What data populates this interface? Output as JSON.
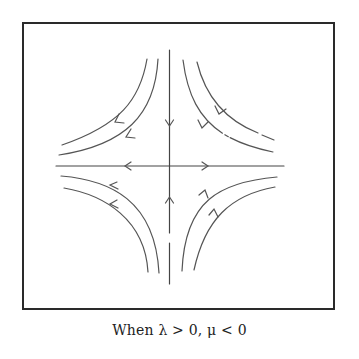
{
  "figure": {
    "caption": "When λ > 0, μ < 0",
    "colors": {
      "frame": "#2a2a2a",
      "curves": "#555555",
      "axes": "#444444",
      "background": "#ffffff"
    },
    "axes": {
      "horizontal": {
        "direction": "outward",
        "arrows": [
          "left",
          "right"
        ]
      },
      "vertical": {
        "direction": "inward",
        "arrows": [
          "down",
          "up"
        ]
      }
    },
    "trajectories": [
      {
        "quadrant": "top-left",
        "count": 2,
        "flow": "down then left"
      },
      {
        "quadrant": "top-right",
        "count": 2,
        "flow": "down then right"
      },
      {
        "quadrant": "bottom-left",
        "count": 2,
        "flow": "up then left"
      },
      {
        "quadrant": "bottom-right",
        "count": 2,
        "flow": "up then right"
      }
    ]
  }
}
